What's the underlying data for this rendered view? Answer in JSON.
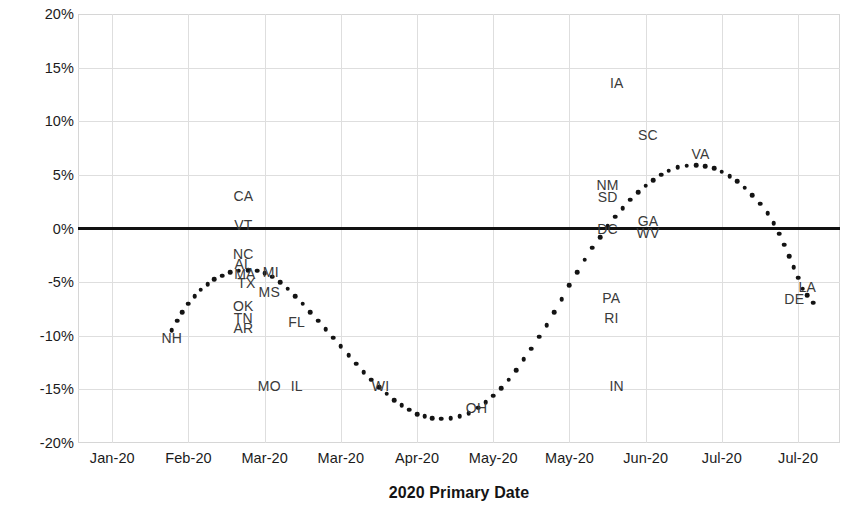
{
  "chart_data": {
    "type": "scatter",
    "title": "",
    "xlabel": "2020 Primary Date",
    "ylabel": "Turnout Rate Change, 2020-2016",
    "ylim": [
      -20,
      20
    ],
    "ytick_labels": [
      "20%",
      "15%",
      "10%",
      "5%",
      "0%",
      "-5%",
      "-10%",
      "-15%",
      "-20%"
    ],
    "ytick_values": [
      20,
      15,
      10,
      5,
      0,
      -5,
      -10,
      -15,
      -20
    ],
    "xtick_labels": [
      "Jan-20",
      "Feb-20",
      "Mar-20",
      "Mar-20",
      "Apr-20",
      "May-20",
      "May-20",
      "Jun-20",
      "Jul-20",
      "Jul-20"
    ],
    "xtick_positions": [
      0,
      1,
      2,
      3,
      4,
      5,
      6,
      7,
      8,
      9
    ],
    "xlim": [
      -0.45,
      9.55
    ],
    "grid": true,
    "legend": null,
    "zero_reference_line": 0,
    "series": [
      {
        "name": "Fitted trend (dotted)",
        "marker": "dotted-curve",
        "points": [
          {
            "x": 0.78,
            "y": -9.5
          },
          {
            "x": 0.85,
            "y": -8.6
          },
          {
            "x": 0.92,
            "y": -7.8
          },
          {
            "x": 1.0,
            "y": -7.0
          },
          {
            "x": 1.08,
            "y": -6.3
          },
          {
            "x": 1.16,
            "y": -5.7
          },
          {
            "x": 1.25,
            "y": -5.2
          },
          {
            "x": 1.34,
            "y": -4.7
          },
          {
            "x": 1.44,
            "y": -4.4
          },
          {
            "x": 1.55,
            "y": -4.1
          },
          {
            "x": 1.66,
            "y": -3.95
          },
          {
            "x": 1.78,
            "y": -3.9
          },
          {
            "x": 1.9,
            "y": -3.95
          },
          {
            "x": 2.0,
            "y": -4.15
          },
          {
            "x": 2.1,
            "y": -4.5
          },
          {
            "x": 2.2,
            "y": -5.0
          },
          {
            "x": 2.3,
            "y": -5.6
          },
          {
            "x": 2.4,
            "y": -6.3
          },
          {
            "x": 2.5,
            "y": -7.0
          },
          {
            "x": 2.6,
            "y": -7.8
          },
          {
            "x": 2.7,
            "y": -8.6
          },
          {
            "x": 2.8,
            "y": -9.4
          },
          {
            "x": 2.9,
            "y": -10.2
          },
          {
            "x": 3.0,
            "y": -11.0
          },
          {
            "x": 3.1,
            "y": -11.8
          },
          {
            "x": 3.2,
            "y": -12.6
          },
          {
            "x": 3.3,
            "y": -13.4
          },
          {
            "x": 3.4,
            "y": -14.1
          },
          {
            "x": 3.5,
            "y": -14.8
          },
          {
            "x": 3.6,
            "y": -15.4
          },
          {
            "x": 3.7,
            "y": -16.0
          },
          {
            "x": 3.8,
            "y": -16.5
          },
          {
            "x": 3.9,
            "y": -16.9
          },
          {
            "x": 4.0,
            "y": -17.3
          },
          {
            "x": 4.1,
            "y": -17.5
          },
          {
            "x": 4.2,
            "y": -17.7
          },
          {
            "x": 4.32,
            "y": -17.75
          },
          {
            "x": 4.44,
            "y": -17.7
          },
          {
            "x": 4.56,
            "y": -17.5
          },
          {
            "x": 4.68,
            "y": -17.2
          },
          {
            "x": 4.8,
            "y": -16.7
          },
          {
            "x": 4.9,
            "y": -16.2
          },
          {
            "x": 5.0,
            "y": -15.6
          },
          {
            "x": 5.1,
            "y": -14.9
          },
          {
            "x": 5.2,
            "y": -14.1
          },
          {
            "x": 5.3,
            "y": -13.2
          },
          {
            "x": 5.4,
            "y": -12.2
          },
          {
            "x": 5.5,
            "y": -11.2
          },
          {
            "x": 5.6,
            "y": -10.1
          },
          {
            "x": 5.7,
            "y": -9.0
          },
          {
            "x": 5.8,
            "y": -7.8
          },
          {
            "x": 5.9,
            "y": -6.6
          },
          {
            "x": 6.0,
            "y": -5.3
          },
          {
            "x": 6.1,
            "y": -4.1
          },
          {
            "x": 6.2,
            "y": -2.9
          },
          {
            "x": 6.3,
            "y": -1.8
          },
          {
            "x": 6.4,
            "y": -0.8
          },
          {
            "x": 6.5,
            "y": 0.2
          },
          {
            "x": 6.6,
            "y": 1.1
          },
          {
            "x": 6.7,
            "y": 1.9
          },
          {
            "x": 6.8,
            "y": 2.7
          },
          {
            "x": 6.9,
            "y": 3.4
          },
          {
            "x": 7.0,
            "y": 4.0
          },
          {
            "x": 7.1,
            "y": 4.5
          },
          {
            "x": 7.2,
            "y": 5.0
          },
          {
            "x": 7.3,
            "y": 5.4
          },
          {
            "x": 7.42,
            "y": 5.7
          },
          {
            "x": 7.54,
            "y": 5.85
          },
          {
            "x": 7.66,
            "y": 5.9
          },
          {
            "x": 7.78,
            "y": 5.8
          },
          {
            "x": 7.9,
            "y": 5.6
          },
          {
            "x": 8.0,
            "y": 5.3
          },
          {
            "x": 8.1,
            "y": 4.9
          },
          {
            "x": 8.2,
            "y": 4.4
          },
          {
            "x": 8.3,
            "y": 3.8
          },
          {
            "x": 8.4,
            "y": 3.1
          },
          {
            "x": 8.5,
            "y": 2.3
          },
          {
            "x": 8.6,
            "y": 1.4
          },
          {
            "x": 8.68,
            "y": 0.5
          },
          {
            "x": 8.75,
            "y": -0.5
          },
          {
            "x": 8.82,
            "y": -1.5
          },
          {
            "x": 8.88,
            "y": -2.6
          },
          {
            "x": 8.94,
            "y": -3.6
          },
          {
            "x": 9.0,
            "y": -4.6
          },
          {
            "x": 9.06,
            "y": -5.6
          },
          {
            "x": 9.12,
            "y": -6.2
          },
          {
            "x": 9.2,
            "y": -6.9
          }
        ]
      }
    ],
    "state_labels": [
      {
        "state": "NH",
        "x": 0.78,
        "y": -10.2
      },
      {
        "state": "CA",
        "x": 1.72,
        "y": 3.0
      },
      {
        "state": "VT",
        "x": 1.72,
        "y": 0.3
      },
      {
        "state": "NC",
        "x": 1.72,
        "y": -2.4
      },
      {
        "state": "AL",
        "x": 1.72,
        "y": -3.3
      },
      {
        "state": "MA",
        "x": 1.74,
        "y": -4.2
      },
      {
        "state": "MI",
        "x": 2.08,
        "y": -4.1
      },
      {
        "state": "TX",
        "x": 1.76,
        "y": -5.1
      },
      {
        "state": "MS",
        "x": 2.06,
        "y": -5.9
      },
      {
        "state": "OK",
        "x": 1.72,
        "y": -7.2
      },
      {
        "state": "TN",
        "x": 1.72,
        "y": -8.3
      },
      {
        "state": "AR",
        "x": 1.72,
        "y": -9.3
      },
      {
        "state": "FL",
        "x": 2.42,
        "y": -8.7
      },
      {
        "state": "MO",
        "x": 2.06,
        "y": -14.7
      },
      {
        "state": "IL",
        "x": 2.42,
        "y": -14.7
      },
      {
        "state": "WI",
        "x": 3.52,
        "y": -14.7
      },
      {
        "state": "OH",
        "x": 4.78,
        "y": -16.7
      },
      {
        "state": "IA",
        "x": 6.62,
        "y": 13.6
      },
      {
        "state": "SC",
        "x": 7.03,
        "y": 8.7
      },
      {
        "state": "VA",
        "x": 7.72,
        "y": 6.9
      },
      {
        "state": "NM",
        "x": 6.5,
        "y": 4.1
      },
      {
        "state": "SD",
        "x": 6.5,
        "y": 2.9
      },
      {
        "state": "GA",
        "x": 7.03,
        "y": 0.7
      },
      {
        "state": "DC",
        "x": 6.5,
        "y": 0.0
      },
      {
        "state": "WV",
        "x": 7.03,
        "y": -0.4
      },
      {
        "state": "PA",
        "x": 6.55,
        "y": -6.5
      },
      {
        "state": "RI",
        "x": 6.55,
        "y": -8.3
      },
      {
        "state": "IN",
        "x": 6.62,
        "y": -14.7
      },
      {
        "state": "LA",
        "x": 9.12,
        "y": -5.5
      },
      {
        "state": "DE",
        "x": 8.95,
        "y": -6.6
      }
    ],
    "colors": {
      "marker": "#131313",
      "zero_line": "#111111",
      "gridline": "#dedede",
      "axis_text": "#1b1b1b",
      "label_text": "#3a3a3a",
      "background": "#ffffff"
    }
  }
}
